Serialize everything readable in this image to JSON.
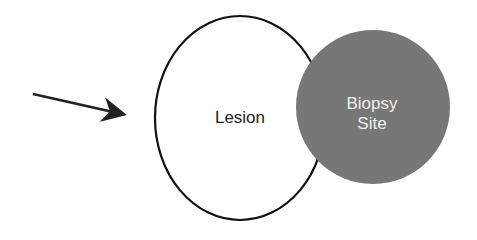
{
  "diagram": {
    "lesion": {
      "label": "Lesion",
      "stroke": "#111111"
    },
    "biopsy_site": {
      "label_line1": "Biopsy",
      "label_line2": "Site",
      "fill": "#777777"
    },
    "arrow": {
      "color": "#222222",
      "points_to": "lesion-edge"
    }
  }
}
